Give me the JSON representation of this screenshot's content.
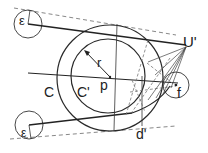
{
  "diagram": {
    "type": "geometric-construction",
    "labels": {
      "eps_top": "ε",
      "eps_bottom": "ε",
      "r": "r",
      "p": "p",
      "C": "C",
      "C_prime": "C'",
      "U_prime": "U'",
      "f": "f",
      "d_prime": "d'"
    },
    "colors": {
      "stroke": "#2a2a2a",
      "dashed": "#777777",
      "text": "#222222"
    }
  }
}
